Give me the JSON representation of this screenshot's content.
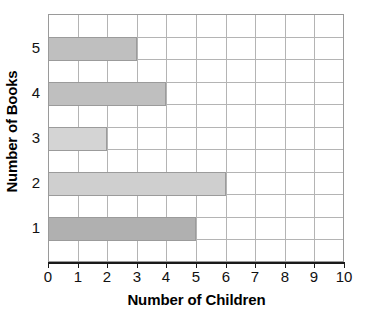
{
  "chart_data": {
    "type": "bar",
    "orientation": "horizontal",
    "title": "",
    "xlabel": "Number of Children",
    "ylabel": "Number of Books",
    "categories": [
      "1",
      "2",
      "3",
      "4",
      "5"
    ],
    "values": [
      5,
      6,
      2,
      4,
      3
    ],
    "xlim": [
      0,
      10
    ],
    "x_ticks": [
      "0",
      "1",
      "2",
      "3",
      "4",
      "5",
      "6",
      "7",
      "8",
      "9",
      "10"
    ],
    "y_ticks": [
      "1",
      "2",
      "3",
      "4",
      "5"
    ],
    "grid": true,
    "legend": "none",
    "bars": [
      {
        "category": "1",
        "value": 5,
        "color": "#b0b0b0"
      },
      {
        "category": "2",
        "value": 6,
        "color": "#cfcfcf"
      },
      {
        "category": "3",
        "value": 2,
        "color": "#d4d4d4"
      },
      {
        "category": "4",
        "value": 4,
        "color": "#bfbfbf"
      },
      {
        "category": "5",
        "value": 3,
        "color": "#bfbfbf"
      }
    ]
  },
  "axes": {
    "x_title": "Number of Children",
    "y_title": "Number of Books",
    "x_tick_labels": [
      "0",
      "1",
      "2",
      "3",
      "4",
      "5",
      "6",
      "7",
      "8",
      "9",
      "10"
    ],
    "y_tick_labels": [
      "5",
      "4",
      "3",
      "2",
      "1"
    ]
  },
  "colors": {
    "grid": "#b4b4b4",
    "axis": "#1a1a1a",
    "border": "#9a9a9a",
    "text": "#111111",
    "background": "#ffffff"
  }
}
